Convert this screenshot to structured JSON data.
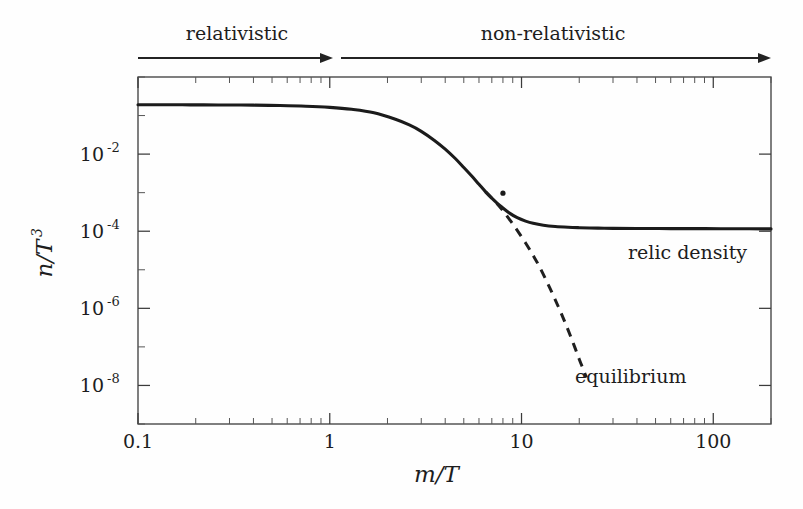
{
  "figure": {
    "background_color": "#fefefe",
    "ink_color": "#1b1b1b"
  },
  "regimes": [
    {
      "id": "relativistic",
      "label": "relativistic",
      "label_x": 237,
      "label_y": 40,
      "arrow_x_start": 138,
      "arrow_x_end": 333,
      "arrow_y": 58
    },
    {
      "id": "non-relativistic",
      "label": "non-relativistic",
      "label_x": 553,
      "label_y": 40,
      "arrow_x_start": 341,
      "arrow_x_end": 771,
      "arrow_y": 58
    }
  ],
  "annotations": [
    {
      "id": "relic-density",
      "text": "relic density",
      "x": 628,
      "y": 259
    },
    {
      "id": "equilibrium",
      "text": "equilibrium",
      "x": 575,
      "y": 383
    }
  ],
  "chart_data": {
    "type": "line",
    "title": "",
    "xlabel": "m/T",
    "ylabel": "n/T^3",
    "xlabel_parts": {
      "num": "m",
      "den": "T"
    },
    "ylabel_parts": {
      "num": "n",
      "den": "T",
      "exp": "3"
    },
    "xscale": "log",
    "yscale": "log",
    "xlim": [
      0.1,
      200
    ],
    "ylim": [
      1e-09,
      1.0
    ],
    "grid": false,
    "legend": "inline-annotations",
    "x_ticks_major": [
      {
        "value": 0.1,
        "label": "0.1"
      },
      {
        "value": 1,
        "label": "1"
      },
      {
        "value": 10,
        "label": "10"
      },
      {
        "value": 100,
        "label": "100"
      }
    ],
    "x_ticks_minor": [
      0.2,
      0.3,
      0.4,
      0.5,
      0.6,
      0.7,
      0.8,
      0.9,
      2,
      3,
      4,
      5,
      6,
      7,
      8,
      9,
      20,
      30,
      40,
      50,
      60,
      70,
      80,
      90,
      200
    ],
    "y_ticks_major": [
      {
        "value": 0.01,
        "mantissa": "10",
        "exponent": "-2"
      },
      {
        "value": 0.0001,
        "mantissa": "10",
        "exponent": "-4"
      },
      {
        "value": 1e-06,
        "mantissa": "10",
        "exponent": "-6"
      },
      {
        "value": 1e-08,
        "mantissa": "10",
        "exponent": "-8"
      }
    ],
    "freeze_out_point": {
      "x": 8.0,
      "y": 0.00097
    },
    "relic_plateau_value": 0.000115,
    "series": [
      {
        "name": "relic density",
        "style": "solid",
        "x": [
          0.1,
          0.13,
          0.17,
          0.22,
          0.3,
          0.4,
          0.55,
          0.75,
          1.0,
          1.3,
          1.7,
          2.2,
          2.6,
          3.0,
          3.5,
          4.0,
          4.5,
          5.0,
          5.5,
          6.0,
          6.5,
          7.0,
          7.5,
          8.0,
          8.7,
          9.5,
          10.5,
          11.5,
          13.0,
          15.0,
          17.5,
          20.0,
          25.0,
          30.0,
          40.0,
          60.0,
          90.0,
          140.0,
          200.0
        ],
        "y": [
          0.19,
          0.19,
          0.19,
          0.189,
          0.188,
          0.186,
          0.182,
          0.175,
          0.163,
          0.145,
          0.118,
          0.08,
          0.057,
          0.039,
          0.023,
          0.0135,
          0.0078,
          0.0045,
          0.0027,
          0.00165,
          0.00105,
          0.00072,
          0.00052,
          0.0004,
          0.00029,
          0.000224,
          0.000183,
          0.00016,
          0.000143,
          0.0001325,
          0.0001265,
          0.0001235,
          0.00012,
          0.0001185,
          0.0001175,
          0.000117,
          0.0001165,
          0.000116,
          0.000115
        ]
      },
      {
        "name": "equilibrium",
        "style": "dashed",
        "x": [
          6.5,
          7.0,
          7.5,
          8.0,
          8.7,
          9.5,
          10.5,
          11.5,
          12.5,
          14.0,
          15.5,
          17.0,
          18.5,
          20.0,
          21.0,
          21.8
        ],
        "y": [
          0.00105,
          0.00072,
          0.0005,
          0.00034,
          0.000195,
          0.000105,
          4.95e-05,
          2.35e-05,
          1.12e-05,
          3.5e-06,
          1.15e-06,
          3.9e-07,
          1.35e-07,
          4.8e-08,
          2.6e-08,
          1.6e-08
        ]
      }
    ]
  },
  "plot_geometry": {
    "left": 138,
    "right": 771,
    "top": 77,
    "bottom": 424,
    "decade_width_px": 191.3,
    "decade_height_px": 40.0
  }
}
